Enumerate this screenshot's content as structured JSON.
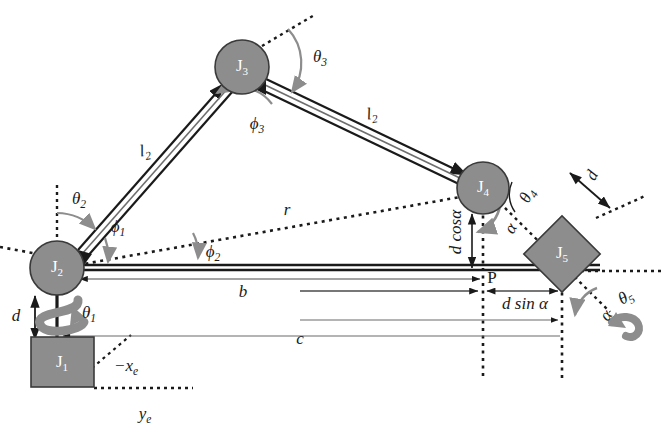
{
  "figure": {
    "type": "kinematic-chain-diagram",
    "background_color": "#ffffff",
    "shape_fill": "#8d8d8d",
    "shape_stroke": "#3a3a3a",
    "line_color": "#1a1a1a",
    "arc_color": "#8d8d8d"
  },
  "joints": [
    {
      "id": "J1",
      "name": "J1",
      "label": "J",
      "subscript": "1",
      "shape": "rectangle",
      "x": 62,
      "y": 362,
      "width": 63,
      "height": 50
    },
    {
      "id": "J2",
      "name": "J2",
      "label": "J",
      "subscript": "2",
      "shape": "circle",
      "x": 57,
      "y": 268,
      "r": 27
    },
    {
      "id": "J3",
      "name": "J3",
      "label": "J",
      "subscript": "3",
      "shape": "circle",
      "x": 242,
      "y": 67,
      "r": 27
    },
    {
      "id": "J4",
      "name": "J4",
      "label": "J",
      "subscript": "4",
      "shape": "circle",
      "x": 483,
      "y": 188,
      "r": 26
    },
    {
      "id": "J5",
      "name": "J5",
      "label": "J",
      "subscript": "5",
      "shape": "diamond",
      "x": 562,
      "y": 254,
      "half": 38
    }
  ],
  "point_labels": [
    {
      "name": "point-p",
      "text": "P",
      "x": 492,
      "y": 279
    }
  ],
  "length_labels": [
    {
      "name": "link-l2-lower",
      "base": "l",
      "sub": "2",
      "x": 145,
      "y": 152
    },
    {
      "name": "link-l2-upper",
      "base": "l",
      "sub": "2",
      "x": 372,
      "y": 115
    },
    {
      "name": "radius-r",
      "base": "r",
      "sub": "",
      "x": 287,
      "y": 211
    },
    {
      "name": "distance-b",
      "base": "b",
      "sub": "",
      "x": 243,
      "y": 293
    },
    {
      "name": "distance-c",
      "base": "c",
      "sub": "",
      "x": 300,
      "y": 340
    },
    {
      "name": "offset-d-left",
      "base": "d",
      "sub": "",
      "x": 16,
      "y": 317
    },
    {
      "name": "offset-d-right",
      "base": "d",
      "sub": "",
      "x": 593,
      "y": 176
    }
  ],
  "angle_labels": [
    {
      "name": "angle-theta1",
      "greek": "θ",
      "sub": "1",
      "x": 89,
      "y": 314
    },
    {
      "name": "angle-theta2",
      "greek": "θ",
      "sub": "2",
      "x": 79,
      "y": 200
    },
    {
      "name": "angle-theta3",
      "greek": "θ",
      "sub": "3",
      "x": 320,
      "y": 58
    },
    {
      "name": "angle-theta4",
      "greek": "θ",
      "sub": "4",
      "x": 528,
      "y": 196
    },
    {
      "name": "angle-theta5",
      "greek": "θ",
      "sub": "5",
      "x": 626,
      "y": 298
    },
    {
      "name": "angle-phi1",
      "greek": "ϕ",
      "sub": "1",
      "x": 118,
      "y": 228
    },
    {
      "name": "angle-phi2",
      "greek": "ϕ",
      "sub": "2",
      "x": 213,
      "y": 253
    },
    {
      "name": "angle-phi3",
      "greek": "ϕ",
      "sub": "3",
      "x": 257,
      "y": 125
    },
    {
      "name": "angle-alpha-j4",
      "greek": "α",
      "sub": "",
      "x": 512,
      "y": 229
    },
    {
      "name": "angle-alpha-j5",
      "greek": "α",
      "sub": "",
      "x": 607,
      "y": 316
    }
  ],
  "expression_labels": [
    {
      "name": "d-cos-alpha",
      "text": "d cosα",
      "x": 457,
      "y": 232,
      "rotated": true
    },
    {
      "name": "d-sin-alpha",
      "text": "d sin α",
      "x": 525,
      "y": 305,
      "rotated": false
    }
  ],
  "axis_labels": [
    {
      "name": "axis-minus-xe",
      "base": "−x",
      "sub": "e",
      "x": 126,
      "y": 367
    },
    {
      "name": "axis-ye",
      "base": "y",
      "sub": "e",
      "x": 145,
      "y": 415
    }
  ]
}
